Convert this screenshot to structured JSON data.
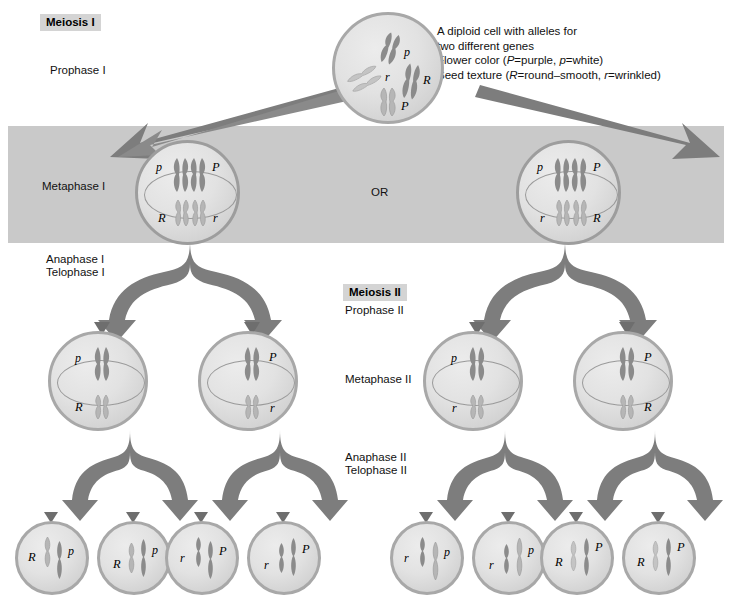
{
  "headers": {
    "meiosis_1": "Meiosis I",
    "meiosis_2": "Meiosis II"
  },
  "phase_labels": {
    "prophase_1": "Prophase I",
    "metaphase_1": "Metaphase I",
    "anaphase_1": "Anaphase I",
    "telophase_1": "Telophase I",
    "prophase_2": "Prophase II",
    "metaphase_2": "Metaphase II",
    "anaphase_2": "Anaphase II",
    "telophase_2": "Telophase II"
  },
  "legend": {
    "line1": "A diploid cell with alleles for",
    "line2": "two different genes",
    "line3_prefix": "Flower color (",
    "line3_p_cap": "P",
    "line3_mid": "=purple, ",
    "line3_p_low": "p",
    "line3_suffix": "=white)",
    "line4_prefix": "Seed texture (",
    "line4_r_cap": "R",
    "line4_mid": "=round–smooth, ",
    "line4_r_low": "r",
    "line4_suffix": "=wrinkled)"
  },
  "or_label": "OR",
  "cells": {
    "parent": {
      "name": "diploid-parent-cell",
      "alleles": [
        "p",
        "r",
        "R",
        "P"
      ]
    },
    "metaphase1_left": {
      "name": "metaphase-i-cell-left",
      "top_left": "p",
      "top_right": "P",
      "bottom_left": "R",
      "bottom_right": "r"
    },
    "metaphase1_right": {
      "name": "metaphase-i-cell-right",
      "top_left": "p",
      "top_right": "P",
      "bottom_left": "r",
      "bottom_right": "R"
    },
    "metaphase2": [
      {
        "name": "metaphase-ii-cell-1",
        "side": "left",
        "top": "p",
        "bottom": "R"
      },
      {
        "name": "metaphase-ii-cell-2",
        "side": "right",
        "top": "P",
        "bottom": "r"
      },
      {
        "name": "metaphase-ii-cell-3",
        "side": "left",
        "top": "p",
        "bottom": "r"
      },
      {
        "name": "metaphase-ii-cell-4",
        "side": "right",
        "top": "P",
        "bottom": "R"
      }
    ],
    "gametes": [
      {
        "name": "gamete-cell-1",
        "left": "R",
        "right": "p"
      },
      {
        "name": "gamete-cell-2",
        "left": "R",
        "right": "p"
      },
      {
        "name": "gamete-cell-3",
        "left": "r",
        "right": "P"
      },
      {
        "name": "gamete-cell-4",
        "left": "r",
        "right": "P"
      },
      {
        "name": "gamete-cell-5",
        "left": "r",
        "right": "p"
      },
      {
        "name": "gamete-cell-6",
        "left": "r",
        "right": "p"
      },
      {
        "name": "gamete-cell-7",
        "left": "R",
        "right": "P"
      },
      {
        "name": "gamete-cell-8",
        "left": "R",
        "right": "P"
      }
    ]
  },
  "colors": {
    "band": "#c9c9c9",
    "header_bg": "#d4d4d4",
    "cell_border": "#a8a8a8",
    "chromosome_dark": "#7a7a7a",
    "chromosome_light": "#bdbdbd",
    "arrow": "#7d7d7d",
    "text": "#111111"
  }
}
